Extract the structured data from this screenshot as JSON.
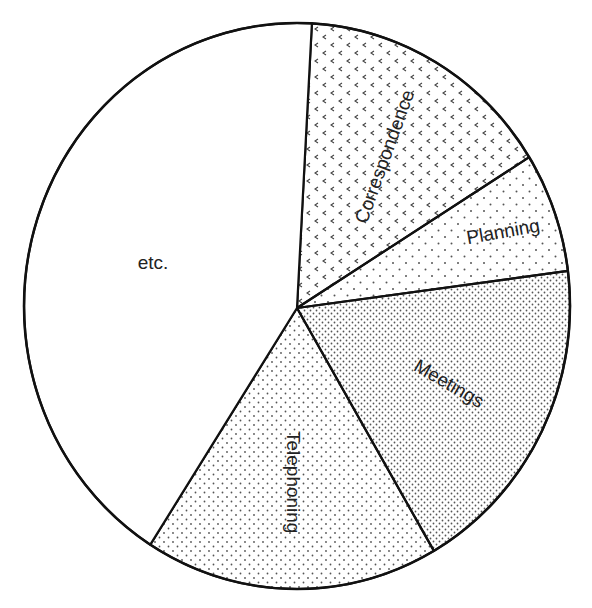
{
  "chart_data": {
    "type": "pie",
    "title": "",
    "start_angle_deg": 3,
    "direction": "clockwise",
    "slices": [
      {
        "label": "Correspondence",
        "value": 15,
        "pattern": "chevron-dots",
        "label_rotation": -70
      },
      {
        "label": "Planning",
        "value": 7,
        "pattern": "sparse-dots",
        "label_rotation": -10
      },
      {
        "label": "Meetings",
        "value": 19,
        "pattern": "dense-dots",
        "label_rotation": 30
      },
      {
        "label": "Telephoning",
        "value": 17,
        "pattern": "medium-dots",
        "label_rotation": 90
      },
      {
        "label": "etc.",
        "value": 42,
        "pattern": "none",
        "label_rotation": 0
      }
    ],
    "legend": "none",
    "grid": false
  },
  "colors": {
    "stroke": "#111111",
    "background": "#ffffff",
    "dots": "#444444",
    "text": "#222222"
  }
}
